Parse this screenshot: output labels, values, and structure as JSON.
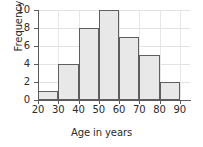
{
  "chart_data": {
    "type": "bar",
    "title": "",
    "xlabel": "Age in years",
    "ylabel": "Frequency",
    "categories": [
      "20-30",
      "30-40",
      "40-50",
      "50-60",
      "60-70",
      "70-80",
      "80-90"
    ],
    "bin_edges": [
      20,
      30,
      40,
      50,
      60,
      70,
      80,
      90
    ],
    "values": [
      1,
      4,
      8,
      10,
      7,
      5,
      2
    ],
    "xlim": [
      20,
      95
    ],
    "ylim": [
      0,
      10
    ],
    "xticks": [
      "20",
      "30",
      "40",
      "50",
      "60",
      "70",
      "80",
      "90"
    ],
    "yticks": [
      "0",
      "2",
      "4",
      "6",
      "8",
      "10"
    ],
    "grid": true,
    "legend": "none",
    "bar_fill_color": "#e8e8e8",
    "bar_edge_color": "#5e5e5e",
    "grid_color": "#e2e2e2",
    "axis_color": "#5a5a5a",
    "text_color": "#2b2b2b"
  }
}
